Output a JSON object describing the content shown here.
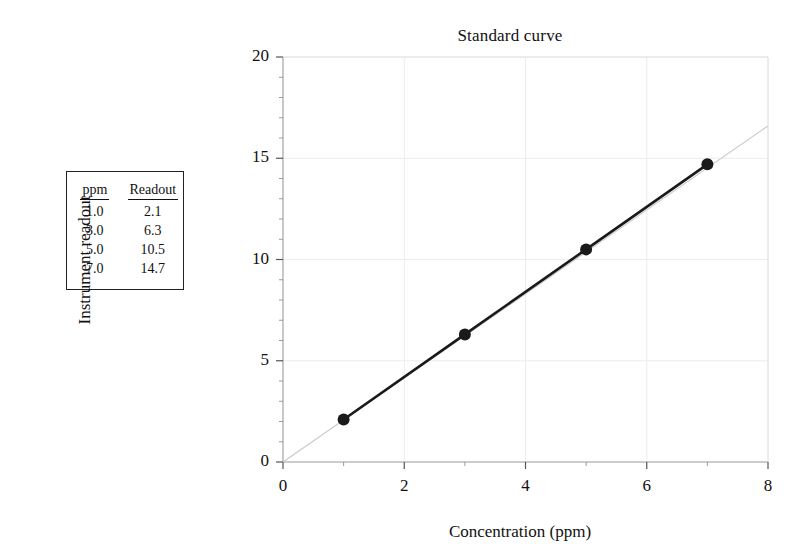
{
  "figure": {
    "background": "#ffffff",
    "ink": "#111111"
  },
  "table": {
    "name": "calibration-data-table",
    "headers": [
      "ppm",
      "Readout"
    ],
    "rows": [
      [
        "1.0",
        "2.1"
      ],
      [
        "3.0",
        "6.3"
      ],
      [
        "5.0",
        "10.5"
      ],
      [
        "7.0",
        "14.7"
      ]
    ]
  },
  "chart_data": {
    "type": "scatter",
    "title": "Standard curve",
    "xlabel": "Concentration (ppm)",
    "ylabel": "Instrument readout",
    "xlim": [
      0,
      8
    ],
    "ylim": [
      0,
      20
    ],
    "xticks": [
      0,
      2,
      4,
      6,
      8
    ],
    "xtick_labels": [
      "0",
      "2",
      "4",
      "6",
      "8"
    ],
    "yticks": [
      0,
      5,
      10,
      15,
      20
    ],
    "ytick_labels": [
      "0",
      "5",
      "10",
      "15",
      "20"
    ],
    "x_minor_tick_step": 1,
    "y_minor_tick_step": 1,
    "grid": true,
    "grid_color": "#ececec",
    "legend": null,
    "series": [
      {
        "name": "Standards",
        "marker": "filled-circle",
        "marker_color": "#1a1a1a",
        "marker_size": 9,
        "line_color": "#1a1a1a",
        "line_width": 2.6,
        "x": [
          1.0,
          3.0,
          5.0,
          7.0
        ],
        "y": [
          2.1,
          6.3,
          10.5,
          14.7
        ]
      },
      {
        "name": "Extrapolated fit line",
        "marker": "none",
        "line_color": "#c9c9c9",
        "line_width": 1.1,
        "x": [
          0.0,
          8.0
        ],
        "y": [
          0.0,
          16.6
        ]
      }
    ]
  }
}
